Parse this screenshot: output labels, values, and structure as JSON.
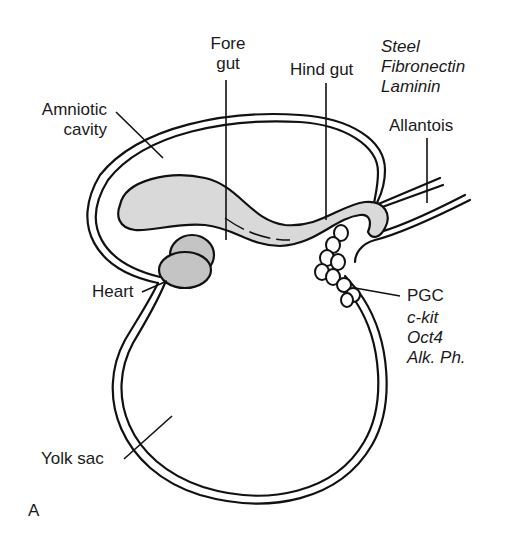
{
  "figure": {
    "panel_label": "A",
    "labels": {
      "fore_gut": [
        "Fore",
        "gut"
      ],
      "hind_gut": "Hind gut",
      "amniotic_cavity": [
        "Amniotic",
        "cavity"
      ],
      "allantois": "Allantois",
      "heart": "Heart",
      "pgc": "PGC",
      "yolk_sac": "Yolk sac"
    },
    "allantois_markers": [
      "Steel",
      "Fibronectin",
      "Laminin"
    ],
    "pgc_markers": [
      "c-kit",
      "Oct4",
      "Alk. Ph."
    ],
    "colors": {
      "outline": "#111111",
      "gut_fill": "#d9d9d9",
      "heart_fill": "#c4c4c4",
      "background": "#ffffff"
    }
  }
}
